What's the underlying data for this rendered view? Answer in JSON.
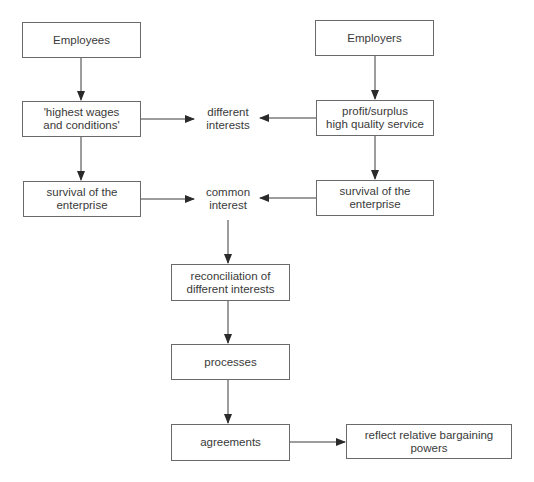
{
  "diagram": {
    "nodes": {
      "employees": "Employees",
      "employers": "Employers",
      "highest_wages": [
        "'highest wages",
        "and conditions'"
      ],
      "profit_surplus": [
        "profit/surplus",
        "high quality service"
      ],
      "survival_left": [
        "survival of the",
        "enterprise"
      ],
      "survival_right": [
        "survival of the",
        "enterprise"
      ],
      "different_interests": [
        "different",
        "interests"
      ],
      "common_interest": [
        "common",
        "interest"
      ],
      "reconciliation": [
        "reconciliation of",
        "different interests"
      ],
      "processes": "processes",
      "agreements": "agreements",
      "reflect": "reflect relative bargaining powers"
    },
    "edges": [
      {
        "from": "employees",
        "to": "highest_wages"
      },
      {
        "from": "highest_wages",
        "to": "survival_left"
      },
      {
        "from": "employers",
        "to": "profit_surplus"
      },
      {
        "from": "profit_surplus",
        "to": "survival_right"
      },
      {
        "from": "highest_wages",
        "to": "different_interests"
      },
      {
        "from": "profit_surplus",
        "to": "different_interests"
      },
      {
        "from": "survival_left",
        "to": "common_interest"
      },
      {
        "from": "survival_right",
        "to": "common_interest"
      },
      {
        "from": "common_interest",
        "to": "reconciliation"
      },
      {
        "from": "reconciliation",
        "to": "processes"
      },
      {
        "from": "processes",
        "to": "agreements"
      },
      {
        "from": "agreements",
        "to": "reflect"
      }
    ],
    "colors": {
      "line": "#3a3a3a",
      "border": "#6a6a6a",
      "text": "#3a3a3a"
    }
  }
}
